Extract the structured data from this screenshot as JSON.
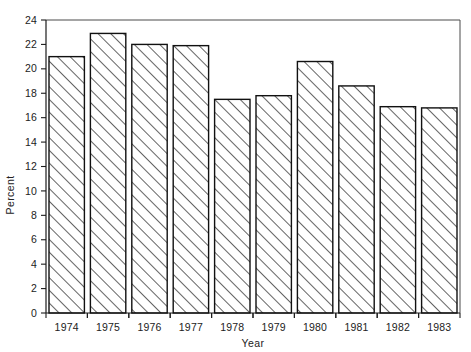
{
  "chart_data": {
    "type": "bar",
    "title": "",
    "xlabel": "Year",
    "ylabel": "Percent",
    "categories": [
      "1974",
      "1975",
      "1976",
      "1977",
      "1978",
      "1979",
      "1980",
      "1981",
      "1982",
      "1983"
    ],
    "values": [
      21.0,
      22.9,
      22.0,
      21.9,
      17.5,
      17.8,
      20.6,
      18.6,
      16.9,
      16.8
    ],
    "ylim": [
      0,
      24
    ],
    "ytick_values": [
      0,
      2,
      4,
      6,
      8,
      10,
      12,
      14,
      16,
      18,
      20,
      22,
      24
    ],
    "ytick_labels": [
      "0",
      "2",
      "4",
      "6",
      "8",
      "10",
      "12",
      "14",
      "16",
      "18",
      "20",
      "22",
      "24"
    ],
    "grid": false,
    "legend": null,
    "bar_fill": "#ffffff",
    "bar_edge": "#111111",
    "bar_pattern": "diagonal-hatch",
    "axis_color": "#1c1c1c",
    "frame_color": "#4a4a4a",
    "background": "#ffffff"
  },
  "figure": {
    "width": 471,
    "height": 352,
    "plot_left": 46,
    "plot_right": 460,
    "plot_top": 20,
    "plot_bottom": 313
  }
}
